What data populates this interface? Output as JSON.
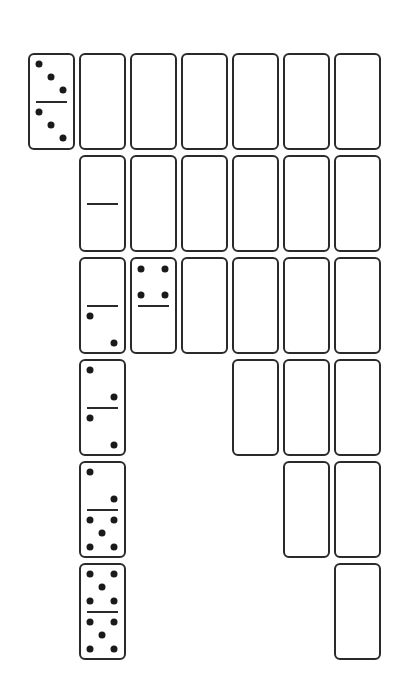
{
  "diagram": {
    "title": "",
    "layout": {
      "col_left": [
        28,
        79,
        130,
        181,
        232,
        283,
        334
      ],
      "row_top": [
        53,
        155,
        257,
        359,
        461,
        563
      ]
    },
    "colors": {
      "stroke": "#2a2a2a",
      "pip": "#1a1a1a",
      "background": "#ffffff"
    },
    "dominoes": [
      {
        "row": 0,
        "col": 0,
        "top": 3,
        "bottom": 3
      },
      {
        "row": 0,
        "col": 1,
        "top": null,
        "bottom": null
      },
      {
        "row": 0,
        "col": 2,
        "top": null,
        "bottom": null
      },
      {
        "row": 0,
        "col": 3,
        "top": null,
        "bottom": null
      },
      {
        "row": 0,
        "col": 4,
        "top": null,
        "bottom": null
      },
      {
        "row": 0,
        "col": 5,
        "top": null,
        "bottom": null
      },
      {
        "row": 0,
        "col": 6,
        "top": null,
        "bottom": null
      },
      {
        "row": 1,
        "col": 1,
        "top": 0,
        "bottom": 0
      },
      {
        "row": 1,
        "col": 2,
        "top": null,
        "bottom": null
      },
      {
        "row": 1,
        "col": 3,
        "top": null,
        "bottom": null
      },
      {
        "row": 1,
        "col": 4,
        "top": null,
        "bottom": null
      },
      {
        "row": 1,
        "col": 5,
        "top": null,
        "bottom": null
      },
      {
        "row": 1,
        "col": 6,
        "top": null,
        "bottom": null
      },
      {
        "row": 2,
        "col": 1,
        "top": 0,
        "bottom": 2
      },
      {
        "row": 2,
        "col": 2,
        "top": 4,
        "bottom": 0
      },
      {
        "row": 2,
        "col": 3,
        "top": null,
        "bottom": null
      },
      {
        "row": 2,
        "col": 4,
        "top": null,
        "bottom": null
      },
      {
        "row": 2,
        "col": 5,
        "top": null,
        "bottom": null
      },
      {
        "row": 2,
        "col": 6,
        "top": null,
        "bottom": null
      },
      {
        "row": 3,
        "col": 1,
        "top": 2,
        "bottom": 2
      },
      {
        "row": 3,
        "col": 4,
        "top": null,
        "bottom": null
      },
      {
        "row": 3,
        "col": 5,
        "top": null,
        "bottom": null
      },
      {
        "row": 3,
        "col": 6,
        "top": null,
        "bottom": null
      },
      {
        "row": 4,
        "col": 1,
        "top": 2,
        "bottom": 5
      },
      {
        "row": 4,
        "col": 5,
        "top": null,
        "bottom": null
      },
      {
        "row": 4,
        "col": 6,
        "top": null,
        "bottom": null
      },
      {
        "row": 5,
        "col": 1,
        "top": 5,
        "bottom": 5
      },
      {
        "row": 5,
        "col": 6,
        "top": null,
        "bottom": null
      }
    ]
  }
}
